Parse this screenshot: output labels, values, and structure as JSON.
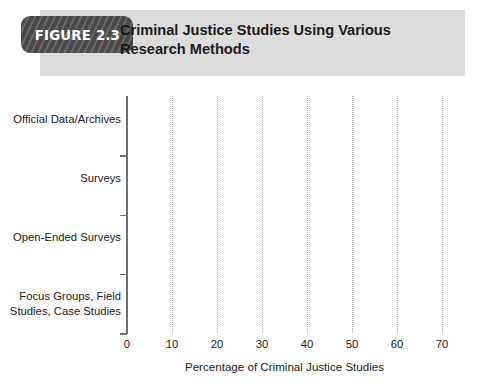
{
  "header": {
    "badge_label": "FIGURE 2.3",
    "title": "Criminal Justice Studies Using Various Research Methods",
    "band_color": "#dcdcdc",
    "badge_color": "#4a4a4a"
  },
  "chart_data": {
    "type": "bar",
    "orientation": "horizontal",
    "title": "Criminal Justice Studies Using Various Research Methods",
    "categories": [
      "Official Data/Archives",
      "Surveys",
      "Open-Ended Surveys",
      "Focus Groups, Field Studies, Case Studies"
    ],
    "values": [
      57.4,
      49.2,
      18,
      6.6
    ],
    "data_labels": [
      "57.4%",
      "49.2%",
      "18%",
      "6.6%"
    ],
    "xlabel": "Percentage of Criminal Justice Studies",
    "ylabel": "",
    "xlim": [
      0,
      70
    ],
    "xticks": [
      0,
      10,
      20,
      30,
      40,
      50,
      60,
      70
    ],
    "xtick_labels": [
      "0",
      "10",
      "20",
      "30",
      "40",
      "50",
      "60",
      "70"
    ],
    "grid": "vertical-dotted",
    "legend": "none",
    "bar_color": "#1a1a1a",
    "label_color": "#ffffff"
  }
}
